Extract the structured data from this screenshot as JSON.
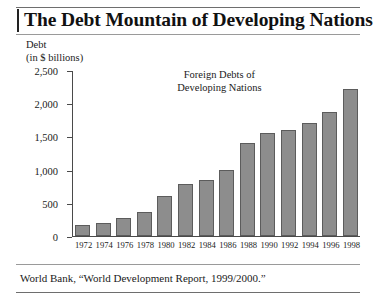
{
  "figure": {
    "title": "The Debt Mountain of Developing Nations",
    "source": "World Bank, “World Development Report, 1999/2000.”",
    "axis_caption_line1": "Debt",
    "axis_caption_line2": "(in $ billions)",
    "annotation_line1": "Foreign Debts of",
    "annotation_line2": "Developing Nations",
    "bar_color": "#8d8d8d",
    "bar_border_color": "#5c5c5c",
    "rule_color": "#6e6e6e"
  },
  "chart_data": {
    "type": "bar",
    "title": "The Debt Mountain of Developing Nations",
    "annotation": "Foreign Debts of Developing Nations",
    "xlabel": "",
    "ylabel": "Debt (in $ billions)",
    "ylim": [
      0,
      2500
    ],
    "yticks": [
      0,
      500,
      1000,
      1500,
      2000,
      2500
    ],
    "ytick_labels": [
      "0",
      "500",
      "1,000",
      "1,500",
      "2,000",
      "2,500"
    ],
    "grid": false,
    "legend": false,
    "categories": [
      "1972",
      "1974",
      "1976",
      "1978",
      "1980",
      "1982",
      "1984",
      "1986",
      "1988",
      "1990",
      "1992",
      "1994",
      "1996",
      "1998"
    ],
    "values": [
      160,
      190,
      270,
      360,
      600,
      790,
      840,
      1000,
      1400,
      1550,
      1600,
      1700,
      1870,
      2220
    ],
    "series": [
      {
        "name": "Foreign Debts of Developing Nations",
        "values": [
          160,
          190,
          270,
          360,
          600,
          790,
          840,
          1000,
          1400,
          1550,
          1600,
          1700,
          1870,
          2220
        ]
      }
    ]
  }
}
